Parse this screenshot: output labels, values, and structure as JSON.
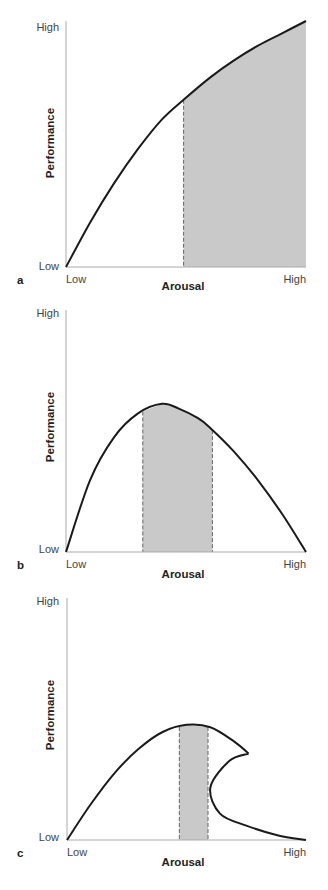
{
  "chart_data": [
    {
      "panel": "a",
      "type": "area",
      "title": "",
      "xlabel": "Arousal",
      "ylabel": "Performance",
      "x_ticks": [
        "Low",
        "High"
      ],
      "y_ticks": [
        "Low",
        "High"
      ],
      "xlim": [
        0,
        1
      ],
      "ylim": [
        0,
        1
      ],
      "curve": {
        "description": "monotonically increasing concave curve",
        "x": [
          0,
          0.1,
          0.2,
          0.3,
          0.4,
          0.49,
          0.6,
          0.7,
          0.8,
          0.9,
          1.0
        ],
        "y": [
          0,
          0.18,
          0.34,
          0.48,
          0.6,
          0.68,
          0.77,
          0.84,
          0.9,
          0.95,
          1.0
        ]
      },
      "shaded_region": {
        "x_start": 0.49,
        "x_end": 1.0
      }
    },
    {
      "panel": "b",
      "type": "area",
      "title": "",
      "xlabel": "Arousal",
      "ylabel": "Performance",
      "x_ticks": [
        "Low",
        "High"
      ],
      "y_ticks": [
        "Low",
        "High"
      ],
      "xlim": [
        0,
        1
      ],
      "ylim": [
        0,
        1
      ],
      "curve": {
        "description": "inverted-U curve",
        "x": [
          0,
          0.1,
          0.2,
          0.3,
          0.4,
          0.47,
          0.55,
          0.6,
          0.7,
          0.8,
          0.9,
          1.0
        ],
        "y": [
          0,
          0.3,
          0.48,
          0.58,
          0.62,
          0.6,
          0.56,
          0.52,
          0.42,
          0.3,
          0.16,
          0
        ]
      },
      "shaded_region": {
        "x_start": 0.32,
        "x_end": 0.61
      }
    },
    {
      "panel": "c",
      "type": "area",
      "title": "",
      "xlabel": "Arousal",
      "ylabel": "Performance",
      "x_ticks": [
        "Low",
        "High"
      ],
      "y_ticks": [
        "Low",
        "High"
      ],
      "xlim": [
        0,
        1
      ],
      "ylim": [
        0,
        1
      ],
      "curve": {
        "description": "catastrophe curve: rises to a peak, folds back at a cusp, then drops to low performance",
        "upper_branch": {
          "x": [
            0,
            0.1,
            0.2,
            0.3,
            0.4,
            0.5,
            0.6,
            0.7,
            0.76
          ],
          "y": [
            0,
            0.15,
            0.28,
            0.38,
            0.45,
            0.48,
            0.47,
            0.41,
            0.36
          ]
        },
        "lower_branch": {
          "x": [
            0.76,
            0.68,
            0.6,
            0.64,
            0.75,
            0.88,
            1.0
          ],
          "y": [
            0.36,
            0.33,
            0.22,
            0.11,
            0.06,
            0.02,
            0.0
          ]
        }
      },
      "shaded_region": {
        "x_start": 0.47,
        "x_end": 0.59
      }
    }
  ]
}
